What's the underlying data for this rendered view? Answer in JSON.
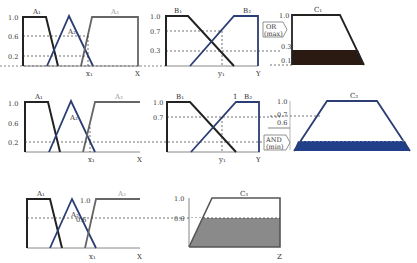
{
  "colors": {
    "black": "#222222",
    "blue": "#2b3d73",
    "gray": "#808080",
    "dark_fill": "#2a1a12",
    "blue_fill": "#22408a",
    "gray_fill": "#8a8a8a"
  },
  "rows": [
    {
      "a_labels": {
        "a1": "A₁",
        "a2": "A₂",
        "a3": "A₃"
      },
      "a_ticks": [
        "1.0",
        "0.6",
        "0.2"
      ],
      "a_axis": {
        "x1": "x₁",
        "end": "X"
      },
      "b_labels": {
        "b1": "B₁",
        "b2": "B₂"
      },
      "b_ticks": [
        "1.0",
        "0.7",
        "0.3"
      ],
      "b_axis": {
        "y1": "y₁",
        "end": "Y"
      },
      "operator": {
        "line1": "OR",
        "line2": "(max)"
      },
      "c_label": "C₁",
      "c_ticks": [
        "1.0",
        "0.3",
        "0.1"
      ]
    },
    {
      "a_labels": {
        "a1": "A₁",
        "a2": "A₂",
        "a3": "A₃"
      },
      "a_ticks": [
        "1.0",
        "0.6",
        "0.2"
      ],
      "a_axis": {
        "x1": "x₁",
        "end": "X"
      },
      "b_labels": {
        "b1": "B₁",
        "b2": "B₂",
        "peak": "1"
      },
      "b_ticks": [
        "1.0",
        "0.7"
      ],
      "b_axis": {
        "y1": "y₁",
        "end": "Y"
      },
      "operator": {
        "line1": "AND",
        "line2": "(min)"
      },
      "c_label": "C₂",
      "c_ticks": [
        "1.0",
        "0.7",
        "0.6"
      ]
    },
    {
      "a_labels": {
        "a1": "A₁",
        "a2": "A₂",
        "a3": "A₃"
      },
      "a_ticks": [
        "1.0",
        "0.6"
      ],
      "a_axis": {
        "x1": "x₁",
        "end": "X"
      },
      "c_label": "C₃",
      "c_ticks": [
        "1.0",
        "0.6"
      ],
      "c_axis": {
        "end": "Z"
      }
    }
  ]
}
